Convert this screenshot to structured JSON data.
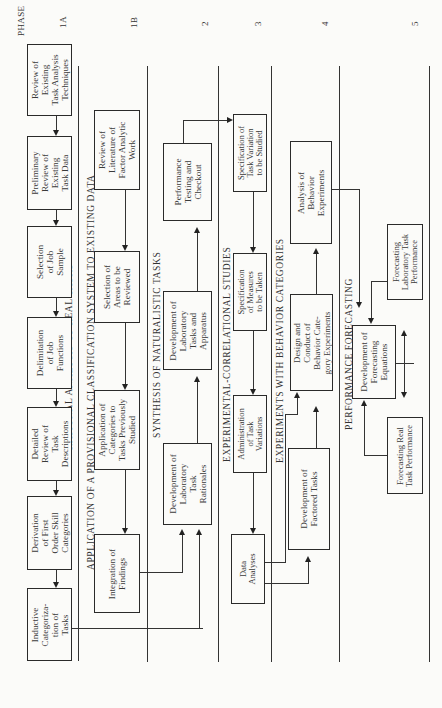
{
  "header": {
    "phase_label": "PHASE",
    "phases": [
      "1A",
      "1B",
      "2",
      "3",
      "4",
      "5"
    ]
  },
  "sections": {
    "s1a": "RATIONAL ANALYSIS OF REAL TASKS",
    "s1b": "APPLICATION OF A PROVISIONAL CLASSIFICATION SYSTEM TO EXISTING DATA",
    "s2": "SYNTHESIS OF NATURALISTIC TASKS",
    "s3": "EXPERIMENTAL-CORRELATIONAL STUDIES",
    "s4": "EXPERIMENTS WITH BEHAVIOR CATEGORIES",
    "s5": "PERFORMANCE FORECASTING"
  },
  "boxes": {
    "review_existing": "Review of\nExisting\nTask Analysis\nTechniques",
    "preliminary_review": "Preliminary\nReview of\nExisting\nTask Data",
    "selection_job": "Selection\nof Job\nSample",
    "delimitation": "Delimitation\nof Job\nFunctions",
    "detailed_review": "Detailed\nReview of\nTask\nDescriptions",
    "derivation": "Derivation\nof First\nOrder Skill\nCategories",
    "inductive": "Inductive\nCategoriza-\ntion of\nTasks",
    "review_literature": "Review of\nLiterature of\nFactor Analytic\nWork",
    "selection_areas": "Selection of\nAreas to be\nReviewed",
    "application": "Application of\nCategories to\nTasks Previously\nStudied",
    "integration": "Integration of\nFindings",
    "performance_testing": "Performance\nTesting and\nCheckout",
    "dev_lab_tasks": "Development of\nLaboratory\nTasks and\nApparatus",
    "dev_lab_rationales": "Development of\nLaboratory\nTask\nRationales",
    "spec_task_variation": "Specification of\nTask Variation\nto be Studied",
    "spec_measures": "Specification\nof Measures\nto be Taken",
    "administration": "Administration\nof Task\nVariations",
    "data_analyses": "Data\nAnalyses",
    "analysis_behavior": "Analysis of\nBehavior\nExperiments",
    "design_conduct": "Design and\nConduct of\nBehavior Cate-\ngory Experiments",
    "dev_factored": "Development of\nFactored Tasks",
    "forecasting_lab": "Forecasting\nLaboratory Task\nPerformance",
    "dev_forecasting_eq": "Development of\nForecasting\nEquations",
    "forecasting_real": "Forecasting Real\nTask Performance"
  }
}
